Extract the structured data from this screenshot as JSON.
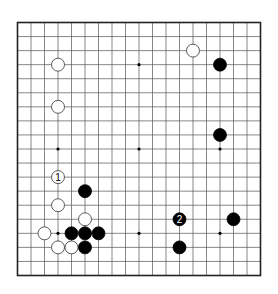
{
  "diagram": {
    "type": "go-board",
    "size": 19,
    "colors": {
      "line": "#555555",
      "border": "#222222",
      "black": "#000000",
      "white": "#ffffff",
      "background": "#ffffff"
    },
    "star_points": [
      [
        3,
        3
      ],
      [
        9,
        3
      ],
      [
        15,
        3
      ],
      [
        3,
        9
      ],
      [
        9,
        9
      ],
      [
        15,
        9
      ],
      [
        3,
        15
      ],
      [
        9,
        15
      ],
      [
        15,
        15
      ]
    ],
    "stones": [
      {
        "color": "white",
        "col": 3,
        "row": 3,
        "label": ""
      },
      {
        "color": "white",
        "col": 3,
        "row": 6,
        "label": ""
      },
      {
        "color": "white",
        "col": 13,
        "row": 2,
        "label": ""
      },
      {
        "color": "black",
        "col": 15,
        "row": 3,
        "label": ""
      },
      {
        "color": "black",
        "col": 15,
        "row": 8,
        "label": ""
      },
      {
        "color": "white",
        "col": 3,
        "row": 11,
        "label": "1"
      },
      {
        "color": "black",
        "col": 5,
        "row": 12,
        "label": ""
      },
      {
        "color": "white",
        "col": 3,
        "row": 13,
        "label": ""
      },
      {
        "color": "white",
        "col": 5,
        "row": 14,
        "label": ""
      },
      {
        "color": "white",
        "col": 2,
        "row": 15,
        "label": ""
      },
      {
        "color": "black",
        "col": 4,
        "row": 15,
        "label": ""
      },
      {
        "color": "black",
        "col": 5,
        "row": 15,
        "label": ""
      },
      {
        "color": "black",
        "col": 6,
        "row": 15,
        "label": ""
      },
      {
        "color": "white",
        "col": 3,
        "row": 16,
        "label": ""
      },
      {
        "color": "white",
        "col": 4,
        "row": 16,
        "label": ""
      },
      {
        "color": "black",
        "col": 5,
        "row": 16,
        "label": ""
      },
      {
        "color": "black",
        "col": 12,
        "row": 14,
        "label": "2"
      },
      {
        "color": "black",
        "col": 16,
        "row": 14,
        "label": ""
      },
      {
        "color": "black",
        "col": 12,
        "row": 16,
        "label": ""
      }
    ]
  }
}
